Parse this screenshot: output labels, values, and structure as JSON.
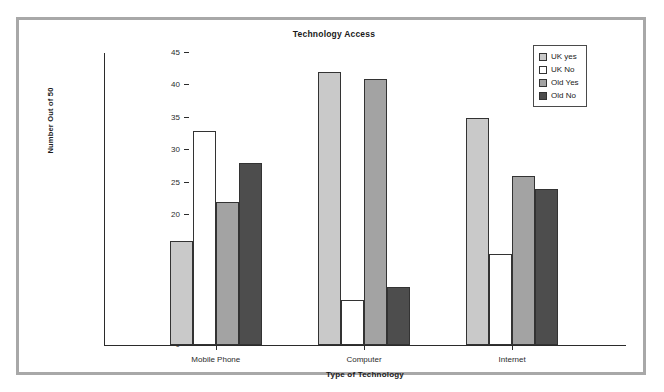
{
  "chart_data": {
    "type": "bar",
    "title": "Technology Access",
    "xlabel": "Type of Technology",
    "ylabel": "Number Out of 50",
    "categories": [
      "Mobile Phone",
      "Computer",
      "Internet"
    ],
    "series": [
      {
        "name": "UK yes",
        "values": [
          16,
          42,
          35
        ],
        "color": "#c9c9c9"
      },
      {
        "name": "UK No",
        "values": [
          33,
          7,
          14
        ],
        "color": "#ffffff"
      },
      {
        "name": "Old Yes",
        "values": [
          22,
          41,
          26
        ],
        "color": "#a3a3a3"
      },
      {
        "name": "Old No",
        "values": [
          28,
          9,
          24
        ],
        "color": "#4d4d4d"
      }
    ],
    "ylim": [
      0,
      45
    ],
    "yticks": [
      0,
      5,
      10,
      15,
      20,
      25,
      30,
      35,
      40,
      45
    ],
    "grid": false,
    "legend_position": "top-right"
  },
  "frame": {
    "border_color": "#a8a8a8"
  }
}
